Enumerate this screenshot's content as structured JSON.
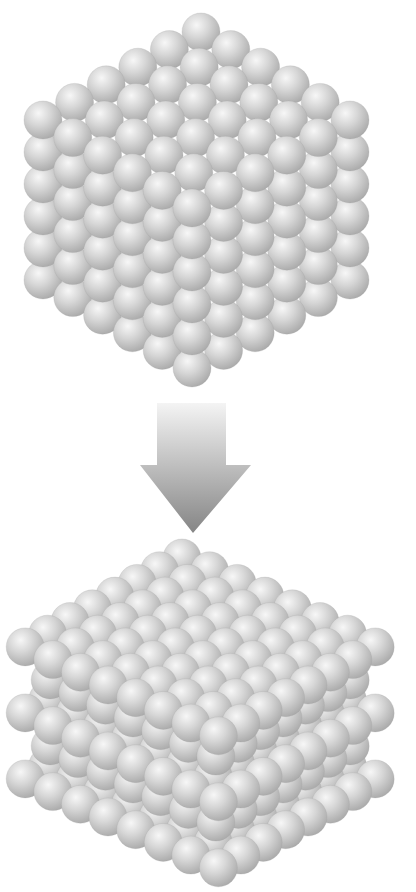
{
  "figure": {
    "title": "",
    "top_caption_fragment": "",
    "background": "#ffffff",
    "sphere": {
      "radius": 19,
      "highlight_color": "#f7f7f7",
      "mid_color": "#d6d6d6",
      "shadow_color": "#a9a9a9",
      "edge_color": "#9a9a9a"
    },
    "top_structure": {
      "label": "cubic lattice block",
      "description": "6 x 6 x 6 cube of spheres (simple cubic packing), isometric view",
      "count_x": 6,
      "count_y": 6,
      "count_z": 6,
      "front_top_center": [
        192,
        208
      ],
      "step_left": [
        -29.8,
        -17.6
      ],
      "step_right": [
        31.6,
        -17.6
      ],
      "step_down": [
        0,
        32
      ]
    },
    "arrow": {
      "label": "transformation arrow",
      "direction": "down",
      "shaft": {
        "x1": 157,
        "x2": 226,
        "y1": 403,
        "y2": 465
      },
      "head": {
        "x1": 140,
        "x2": 251,
        "y": 465,
        "tip_x": 193,
        "tip_y": 533
      },
      "gradient_top": "#f4f4f4",
      "gradient_bottom": "#858585"
    },
    "bottom_structure": {
      "label": "layered close-packed slab",
      "description": "3 visible layers of 8 x 8 spheres with offset intermediate layers (ABAB stacking), isometric view",
      "count_x": 8,
      "count_y": 8,
      "visible_layers": 3,
      "top_vertex_center": [
        182,
        558
      ],
      "step_left": [
        -22.4,
        12.7
      ],
      "step_right": [
        27.6,
        12.7
      ],
      "layer_spacing": 66,
      "intermediate_offset": 33
    }
  }
}
